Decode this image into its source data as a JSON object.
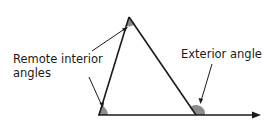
{
  "diagram": {
    "labels": {
      "remote_line1": "Remote interior",
      "remote_line2": "angles",
      "exterior": "Exterior angle"
    },
    "colors": {
      "line": "#1a1a1a",
      "angle_fill": "#8c8c8c",
      "background": "#ffffff"
    }
  }
}
